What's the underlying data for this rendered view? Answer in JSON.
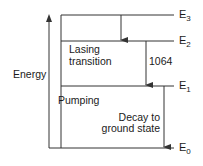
{
  "diagram": {
    "title": "",
    "axis_label": "Energy",
    "levels": [
      {
        "name": "E",
        "sub": "3",
        "y": 15
      },
      {
        "name": "E",
        "sub": "2",
        "y": 41
      },
      {
        "name": "E",
        "sub": "1",
        "y": 86
      },
      {
        "name": "E",
        "sub": "0",
        "y": 148
      }
    ],
    "labels": {
      "lasing_line1": "Lasing",
      "lasing_line2": "transition",
      "wavelength": "1064",
      "pumping": "Pumping",
      "decay_line1": "Decay to",
      "decay_line2": "ground state"
    },
    "transitions": [
      {
        "from": "E3",
        "to": "E2",
        "type": "non-radiative"
      },
      {
        "from": "E2",
        "to": "E1",
        "type": "lasing",
        "label": "1064"
      },
      {
        "from": "E1",
        "to": "E0",
        "type": "decay"
      }
    ],
    "colors": {
      "line": "#333333",
      "text": "#1a1a1a",
      "background": "#ffffff"
    }
  }
}
